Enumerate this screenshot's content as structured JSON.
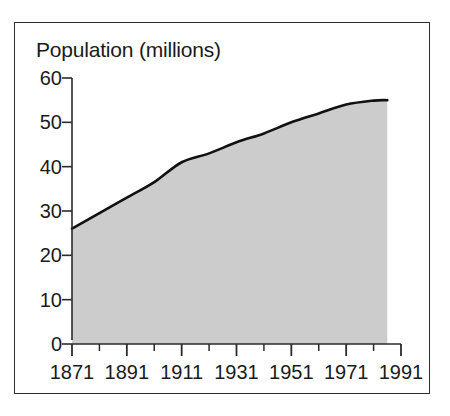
{
  "chart_data": {
    "type": "area",
    "title": "Population (millions)",
    "xlabel": "",
    "ylabel": "Population (millions)",
    "x": [
      1871,
      1881,
      1891,
      1901,
      1911,
      1921,
      1931,
      1941,
      1951,
      1961,
      1971,
      1981,
      1986
    ],
    "values": [
      26.0,
      29.5,
      33.0,
      36.5,
      41.0,
      43.0,
      45.5,
      47.5,
      50.0,
      52.0,
      54.0,
      54.9,
      55.0
    ],
    "series": [
      {
        "name": "Population",
        "values": [
          26.0,
          29.5,
          33.0,
          36.5,
          41.0,
          43.0,
          45.5,
          47.5,
          50.0,
          52.0,
          54.0,
          54.9,
          55.0
        ]
      }
    ],
    "xlim": [
      1871,
      1991
    ],
    "ylim": [
      0,
      60
    ],
    "x_major_ticks": [
      1871,
      1891,
      1911,
      1931,
      1951,
      1971,
      1991
    ],
    "x_minor_ticks": [
      1881,
      1901,
      1921,
      1941,
      1961,
      1981
    ],
    "y_ticks": [
      0,
      10,
      20,
      30,
      40,
      50,
      60
    ],
    "xtick_labels": [
      "1871",
      "1891",
      "1911",
      "1931",
      "1951",
      "1971",
      "1991"
    ],
    "ytick_labels": [
      "0",
      "10",
      "20",
      "30",
      "40",
      "50",
      "60"
    ],
    "grid": false,
    "legend": false,
    "legend_position": "none",
    "area_fill_color": "#cccccc",
    "line_color": "#111111",
    "axis_color": "#2b2b2b",
    "background_color": "#ffffff",
    "frame_color": "#2b2b2b"
  },
  "figure": {
    "axis_title": "Population (millions)"
  }
}
